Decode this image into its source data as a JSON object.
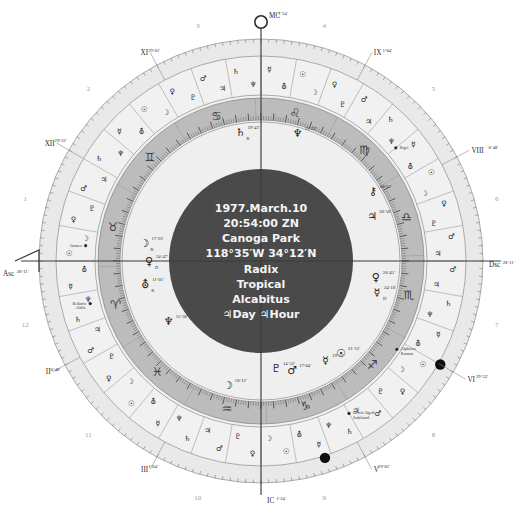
{
  "chart": {
    "center_lines": [
      "1977.March.10",
      "20:54:00 ZN",
      "Canoga Park",
      "118°35′W 34°12′N",
      "Radix",
      "Tropical",
      "Alcabitus",
      "♃Day ♃Hour"
    ],
    "colors": {
      "core": "#4a4a4a",
      "zodiac_band": "#bcbcbc",
      "outer_ring": "#e9e9e9",
      "house_ring": "#f1f1f1",
      "inner_ring": "#efefef",
      "text_light": "#f4f4f4",
      "line": "#6d6d6d"
    },
    "axes": [
      {
        "name": "MC",
        "label": "MC",
        "degree": "1°24′",
        "angle_deg": 90
      },
      {
        "name": "IC",
        "label": "IC",
        "degree": "1°24′",
        "angle_deg": 270
      },
      {
        "name": "Asc",
        "label": "Asc",
        "degree": "28°11′",
        "angle_deg": 180
      },
      {
        "name": "Dsc",
        "label": "Dsc",
        "degree": "28°11′",
        "angle_deg": 0
      }
    ],
    "house_cusps": [
      {
        "roman": "XI",
        "degree": "29°01′",
        "angle_deg": 118
      },
      {
        "roman": "XII",
        "degree": "29°33′",
        "angle_deg": 150
      },
      {
        "roman": "IX",
        "degree": "1°04′",
        "angle_deg": 62
      },
      {
        "roman": "VIII",
        "degree": "0°48′",
        "angle_deg": 28
      },
      {
        "roman": "VI",
        "degree": "29°33′",
        "angle_deg": 330
      },
      {
        "roman": "V",
        "degree": "29°01′",
        "angle_deg": 298
      },
      {
        "roman": "III",
        "degree": "1°04′",
        "angle_deg": 242
      },
      {
        "roman": "II",
        "degree": "0°48′",
        "angle_deg": 208
      }
    ],
    "house_numbers": [
      "1",
      "2",
      "3",
      "4",
      "5",
      "6",
      "7",
      "8",
      "9",
      "10",
      "11",
      "12"
    ],
    "zodiac_signs": [
      {
        "name": "Aries",
        "glyph": "♈"
      },
      {
        "name": "Taurus",
        "glyph": "♉"
      },
      {
        "name": "Gemini",
        "glyph": "♊"
      },
      {
        "name": "Cancer",
        "glyph": "♋"
      },
      {
        "name": "Leo",
        "glyph": "♌"
      },
      {
        "name": "Virgo",
        "glyph": "♍"
      },
      {
        "name": "Libra",
        "glyph": "♎"
      },
      {
        "name": "Scorpio",
        "glyph": "♏"
      },
      {
        "name": "Sagittarius",
        "glyph": "♐"
      },
      {
        "name": "Capricorn",
        "glyph": "♑"
      },
      {
        "name": "Aquarius",
        "glyph": "♒"
      },
      {
        "name": "Pisces",
        "glyph": "♓"
      }
    ],
    "planets": [
      {
        "name": "Moon",
        "glyph": "☽",
        "degree": "17°26′",
        "retro": "R",
        "angle_deg": 171,
        "radius": 118
      },
      {
        "name": "Venus",
        "glyph": "♀",
        "degree": "24°47′",
        "retro": "D",
        "angle_deg": 180,
        "radius": 112
      },
      {
        "name": "Uranus",
        "glyph": "⛢",
        "degree": "11°01′",
        "retro": "R",
        "angle_deg": 191,
        "radius": 118
      },
      {
        "name": "Saturn",
        "glyph": "♄",
        "degree": "19°43′",
        "retro": "R",
        "angle_deg": 99,
        "radius": 131
      },
      {
        "name": "Neptune",
        "glyph": "♆",
        "degree": "15°22′",
        "retro": "",
        "angle_deg": 74,
        "radius": 133
      },
      {
        "name": "Jupiter",
        "glyph": "♃",
        "degree": "20°50′",
        "retro": "",
        "angle_deg": 22,
        "radius": 120
      },
      {
        "name": "Chiron",
        "glyph": "⚷",
        "degree": "08°52′",
        "retro": "",
        "angle_deg": 32,
        "radius": 132
      },
      {
        "name": "Venus2",
        "glyph": "♀",
        "degree": "20°45′",
        "retro": "",
        "angle_deg": 352,
        "radius": 116
      },
      {
        "name": "Mercury",
        "glyph": "☿",
        "degree": "24°18′",
        "retro": "D",
        "angle_deg": 345,
        "radius": 120
      },
      {
        "name": "Sun",
        "glyph": "☉",
        "degree": "21°12′",
        "retro": "",
        "angle_deg": 311,
        "radius": 122
      },
      {
        "name": "Mercury2",
        "glyph": "☿",
        "degree": "19°52′",
        "retro": "",
        "angle_deg": 303,
        "radius": 118
      },
      {
        "name": "Mars",
        "glyph": "♂",
        "degree": "17°04′",
        "retro": "",
        "angle_deg": 286,
        "radius": 113
      },
      {
        "name": "Pluto",
        "glyph": "♇",
        "degree": "14°52′",
        "retro": "",
        "angle_deg": 278,
        "radius": 108
      },
      {
        "name": "Neptune2",
        "glyph": "♆",
        "degree": "15°38′",
        "retro": "",
        "angle_deg": 213,
        "radius": 110
      },
      {
        "name": "Moon2",
        "glyph": "☽",
        "degree": "18°12′",
        "retro": "",
        "angle_deg": 255,
        "radius": 128
      }
    ],
    "fixed_stars": [
      {
        "name": "Antares",
        "angle_deg": 175,
        "radius": 176
      },
      {
        "name": "Bellatrix\nAldeb.",
        "angle_deg": 194,
        "radius": 176
      },
      {
        "name": "Rigel",
        "angle_deg": 40,
        "radius": 176
      },
      {
        "name": "Deneb Algedi\nSadalsuud",
        "angle_deg": 300,
        "radius": 176
      },
      {
        "name": "Alphecca\nRomani",
        "angle_deg": 327,
        "radius": 162
      }
    ],
    "lunar_nodes": [
      {
        "name": "north-node-marker",
        "angle_deg": 330
      },
      {
        "name": "south-node-marker",
        "angle_deg": 288
      }
    ]
  }
}
